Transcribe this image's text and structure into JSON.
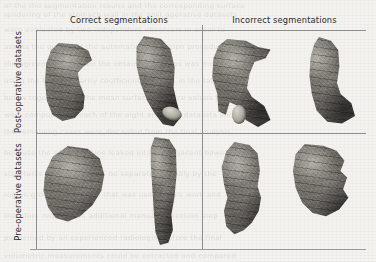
{
  "figure": {
    "columns": [
      {
        "id": "correct",
        "label": "Correct segmentations"
      },
      {
        "id": "incorrect",
        "label": "Incorrect segmentations"
      }
    ],
    "rows": [
      {
        "id": "post",
        "label": "Post-operative datasets"
      },
      {
        "id": "pre",
        "label": "Pre-operative datasets"
      }
    ],
    "cells": [
      {
        "row": "post",
        "column": "correct",
        "renderings": [
          {
            "id": "post-correct-1",
            "caption": "3D stomach surface rendering, C-shaped lateral view"
          },
          {
            "id": "post-correct-2",
            "caption": "3D stomach surface rendering, upright sleeve view"
          }
        ]
      },
      {
        "row": "post",
        "column": "incorrect",
        "renderings": [
          {
            "id": "post-incorrect-1",
            "caption": "3D stomach surface rendering with spurious leaked region"
          },
          {
            "id": "post-incorrect-2",
            "caption": "3D stomach surface rendering with over-segmented flange"
          }
        ]
      },
      {
        "row": "pre",
        "column": "correct",
        "renderings": [
          {
            "id": "pre-correct-1",
            "caption": "3D stomach surface rendering, full J-shaped organ"
          },
          {
            "id": "pre-correct-2",
            "caption": "3D stomach surface rendering, elongated vertical view"
          }
        ]
      },
      {
        "row": "pre",
        "column": "incorrect",
        "renderings": [
          {
            "id": "pre-incorrect-1",
            "caption": "3D stomach surface rendering with boundary leak"
          },
          {
            "id": "pre-incorrect-2",
            "caption": "3D stomach surface rendering with merged neighbour tissue"
          }
        ]
      }
    ],
    "colors": {
      "page_background": "#f3f2ef",
      "rule": "#8d8d8d",
      "label_text": "#2b2b2b",
      "mesh_light": "#8b8882",
      "mesh_mid": "#5f5c57",
      "mesh_dark": "#3e3c39",
      "mesh_tip": "#d8d4cb"
    }
  },
  "background_bleed": {
    "note": "faint mirrored print showing through the scanned page",
    "lines": [
      "of the the segmentation results and the corresponding surface",
      "rendering of the stomach wall in the post operative datasets",
      "were evaluated by two independent observers in order to",
      "assess the quality of the automatic delineation procedure and",
      "the agreement between the obtained volumes was measured",
      "using the Dice similarity coefficient reported in the table",
      "below together with the mean surface distance values that",
      "were computed for each of the eight analysed datasets and",
      "the remaining cases were discarded from the final analysis",
      "because the segmentation leaked into the adjacent bowel",
      "structures which could not be separated reliably by the",
      "region growing algorithm that was used in this work and",
      "therefore required an additional manual correction step",
      "performed by an experienced radiologist before the final",
      "volumetric measurements could be extracted and compared"
    ]
  }
}
